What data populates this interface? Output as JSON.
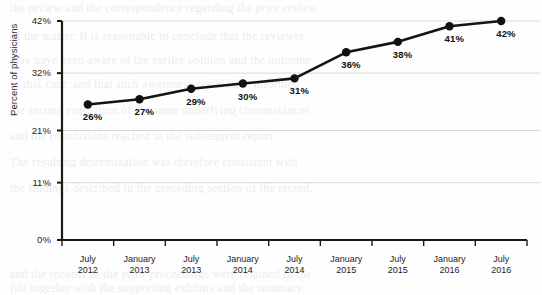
{
  "chart_data": {
    "type": "line",
    "title": "",
    "xlabel": "",
    "ylabel": "Percent of physicians",
    "categories": [
      "July 2012",
      "January 2013",
      "July 2013",
      "January 2014",
      "July 2014",
      "January 2015",
      "July 2015",
      "January 2016",
      "July 2016"
    ],
    "category_lines": [
      [
        "July",
        "2012"
      ],
      [
        "January",
        "2013"
      ],
      [
        "July",
        "2013"
      ],
      [
        "January",
        "2014"
      ],
      [
        "July",
        "2014"
      ],
      [
        "January",
        "2015"
      ],
      [
        "July",
        "2015"
      ],
      [
        "January",
        "2016"
      ],
      [
        "July",
        "2016"
      ]
    ],
    "values": [
      26,
      27,
      29,
      30,
      31,
      36,
      38,
      41,
      42
    ],
    "point_labels": [
      "26%",
      "27%",
      "29%",
      "30%",
      "31%",
      "36%",
      "38%",
      "41%",
      "42%"
    ],
    "ylim": [
      0,
      42
    ],
    "yticks": [
      0,
      11,
      21,
      32,
      42
    ],
    "ytick_labels": [
      "0%",
      "11%",
      "21%",
      "32%",
      "42%"
    ],
    "grid": true,
    "legend": "none",
    "colors": {
      "line": "#141414",
      "marker": "#101010",
      "grid": "#d8d8d8",
      "axis": "#1a1a1a",
      "text": "#1d1d1d",
      "background": "#fefefe"
    }
  },
  "background_text": {
    "lines": [
      "the review and the correspondence regarding the prior review",
      "of the matter. It is reasonable to conclude that the reviewer",
      "may have been aware of the earlier opinion and the outcome",
      "in that case, and that such awareness could have informed",
      "the second evaluation of the same underlying circumstances",
      "and the conclusions reached in the subsequent report.",
      "The resulting determination was therefore consistent with",
      "the findings described in the preceding section of the record."
    ],
    "footer_lines": [
      "and the records of the prior proceedings were retained in the",
      "file together with the supporting exhibits and the summary."
    ]
  }
}
